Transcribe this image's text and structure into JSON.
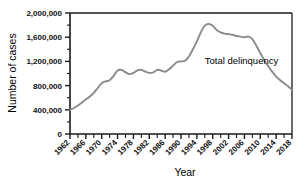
{
  "chart_data": {
    "type": "line",
    "title": "",
    "xlabel": "Year",
    "ylabel": "Number of cases",
    "xlim": [
      1962,
      2018
    ],
    "ylim": [
      0,
      2000000
    ],
    "grid": false,
    "legend_position": "inline-annotation",
    "y_ticks": [
      "0",
      "400,000",
      "800,000",
      "1,200,000",
      "1,600,000",
      "2,000,000"
    ],
    "y_tick_values": [
      0,
      400000,
      800000,
      1200000,
      1600000,
      2000000
    ],
    "y_minor_tick_values": [
      200000,
      600000,
      1000000,
      1400000,
      1800000
    ],
    "x_ticks": [
      "1962",
      "1966",
      "1970",
      "1974",
      "1978",
      "1982",
      "1986",
      "1990",
      "1994",
      "1998",
      "2002",
      "2006",
      "2010",
      "2014",
      "2018"
    ],
    "x_tick_values": [
      1962,
      1966,
      1970,
      1974,
      1978,
      1982,
      1986,
      1990,
      1994,
      1998,
      2002,
      2006,
      2010,
      2014,
      2018
    ],
    "x_minor_tick_values": [
      1964,
      1968,
      1972,
      1976,
      1980,
      1984,
      1988,
      1992,
      1996,
      2000,
      2004,
      2008,
      2012,
      2016
    ],
    "annotations": [
      {
        "text": "Total delinquency",
        "x": 1996,
        "y": 1150000
      }
    ],
    "series": [
      {
        "name": "Total delinquency",
        "color": "#8a8a8a",
        "x": [
          1962,
          1963,
          1964,
          1965,
          1966,
          1967,
          1968,
          1969,
          1970,
          1971,
          1972,
          1973,
          1974,
          1975,
          1976,
          1977,
          1978,
          1979,
          1980,
          1981,
          1982,
          1983,
          1984,
          1985,
          1986,
          1987,
          1988,
          1989,
          1990,
          1991,
          1992,
          1993,
          1994,
          1995,
          1996,
          1997,
          1998,
          1999,
          2000,
          2001,
          2002,
          2003,
          2004,
          2005,
          2006,
          2007,
          2008,
          2009,
          2010,
          2011,
          2012,
          2013,
          2014,
          2015,
          2016,
          2017,
          2018
        ],
        "values": [
          400000,
          430000,
          470000,
          520000,
          570000,
          620000,
          680000,
          760000,
          840000,
          870000,
          890000,
          960000,
          1050000,
          1060000,
          1020000,
          990000,
          1010000,
          1050000,
          1060000,
          1030000,
          1010000,
          1020000,
          1060000,
          1050000,
          1030000,
          1070000,
          1130000,
          1190000,
          1200000,
          1210000,
          1280000,
          1400000,
          1530000,
          1680000,
          1790000,
          1820000,
          1790000,
          1720000,
          1680000,
          1660000,
          1650000,
          1640000,
          1620000,
          1610000,
          1600000,
          1610000,
          1570000,
          1460000,
          1340000,
          1220000,
          1120000,
          1030000,
          950000,
          890000,
          840000,
          790000,
          730000
        ]
      }
    ]
  },
  "axes": {
    "y_title": "Number of cases",
    "x_title": "Year"
  }
}
